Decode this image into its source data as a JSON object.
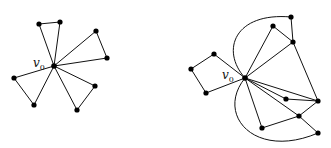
{
  "figures": [
    {
      "id": "left",
      "center_label": "v",
      "center_subscript": "0",
      "center": [
        54,
        66
      ],
      "label_pos": [
        33,
        67
      ],
      "nodes": [
        [
          39,
          24
        ],
        [
          60,
          22
        ],
        [
          96,
          31
        ],
        [
          107,
          58
        ],
        [
          14,
          78
        ],
        [
          34,
          105
        ],
        [
          95,
          86
        ],
        [
          77,
          110
        ]
      ],
      "edges": [
        [
          0,
          1
        ],
        [
          2,
          3
        ],
        [
          4,
          5
        ],
        [
          6,
          7
        ]
      ],
      "spokes": [
        0,
        1,
        2,
        3,
        4,
        5,
        6,
        7
      ],
      "arcs": []
    },
    {
      "id": "right",
      "center_label": "v",
      "center_subscript": "0",
      "center": [
        245,
        78
      ],
      "label_pos": [
        222,
        79
      ],
      "nodes": [
        [
          291,
          17
        ],
        [
          273,
          26
        ],
        [
          293,
          42
        ],
        [
          214,
          54
        ],
        [
          191,
          69
        ],
        [
          206,
          93
        ],
        [
          286,
          99
        ],
        [
          318,
          101
        ],
        [
          299,
          116
        ],
        [
          262,
          128
        ],
        [
          318,
          133
        ]
      ],
      "edges": [
        [
          1,
          2
        ],
        [
          2,
          0
        ],
        [
          3,
          4
        ],
        [
          4,
          5
        ],
        [
          6,
          7
        ],
        [
          7,
          2
        ],
        [
          8,
          7
        ],
        [
          9,
          8
        ],
        [
          8,
          10
        ]
      ],
      "spokes": [
        1,
        2,
        3,
        5,
        6,
        7,
        8,
        9
      ],
      "arcs": [
        {
          "d": "M245,78 C220,50 235,12 291,17"
        },
        {
          "d": "M245,78 C215,115 255,160 318,133"
        }
      ]
    }
  ]
}
